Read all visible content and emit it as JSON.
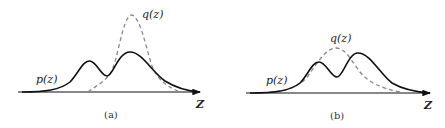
{
  "figure": {
    "panels": [
      {
        "caption": "(a)",
        "p_label": "p(z)",
        "q_label": "q(z)",
        "axis_label": "Z"
      },
      {
        "caption": "(b)",
        "p_label": "p(z)",
        "q_label": "q(z)",
        "axis_label": "Z"
      }
    ]
  },
  "colors": {
    "p_curve": "#111111",
    "q_curve": "#888888",
    "axis": "#111111"
  }
}
